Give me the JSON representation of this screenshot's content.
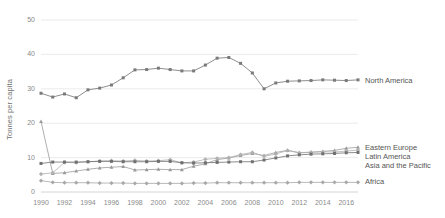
{
  "chart_data": {
    "type": "line",
    "title": "",
    "subtitle": "",
    "xlabel": "",
    "ylabel": "Tonnes per capita",
    "xlim": [
      1990,
      2017
    ],
    "ylim": [
      0,
      50
    ],
    "grid": true,
    "legend_position": "right-inline",
    "x": [
      1990,
      1991,
      1992,
      1993,
      1994,
      1995,
      1996,
      1997,
      1998,
      1999,
      2000,
      2001,
      2002,
      2003,
      2004,
      2005,
      2006,
      2007,
      2008,
      2009,
      2010,
      2011,
      2012,
      2013,
      2014,
      2015,
      2016,
      2017
    ],
    "xtick_labels": [
      "1990",
      "1992",
      "1994",
      "1996",
      "1998",
      "2000",
      "2002",
      "2004",
      "2006",
      "2008",
      "2010",
      "2012",
      "2014",
      "2016"
    ],
    "xtick_values": [
      1990,
      1992,
      1994,
      1996,
      1998,
      2000,
      2002,
      2004,
      2006,
      2008,
      2010,
      2012,
      2014,
      2016
    ],
    "ytick_labels": [
      "0",
      "10",
      "20",
      "30",
      "40",
      "50"
    ],
    "ytick_values": [
      0,
      10,
      20,
      30,
      40,
      50
    ],
    "series": [
      {
        "name": "North America",
        "color": "#7a7a7a",
        "marker": "square",
        "values": [
          28.7,
          27.6,
          28.5,
          27.4,
          29.7,
          30.2,
          31.1,
          33.2,
          35.5,
          35.6,
          36.0,
          35.6,
          35.2,
          35.2,
          36.9,
          38.9,
          39.1,
          37.4,
          34.6,
          30.0,
          31.7,
          32.2,
          32.3,
          32.4,
          32.6,
          32.5,
          32.4,
          32.6
        ]
      },
      {
        "name": "Eastern Europe",
        "color": "#9a9a9a",
        "marker": "triangle",
        "values": [
          20.5,
          5.4,
          5.6,
          6.1,
          6.6,
          7.0,
          7.2,
          7.4,
          6.4,
          6.5,
          6.6,
          6.5,
          6.5,
          7.5,
          8.2,
          9.4,
          9.9,
          10.6,
          11.2,
          10.6,
          11.5,
          12.1,
          11.4,
          11.6,
          11.8,
          12.1,
          12.7,
          13.0
        ]
      },
      {
        "name": "Latin America",
        "color": "#b0b0b0",
        "marker": "diamond",
        "values": [
          5.2,
          5.6,
          8.6,
          8.5,
          8.8,
          9.0,
          9.1,
          9.0,
          9.2,
          9.0,
          9.1,
          9.4,
          8.5,
          8.7,
          9.5,
          9.8,
          10.0,
          10.9,
          11.5,
          10.4,
          11.0,
          12.1,
          11.4,
          11.5,
          11.7,
          11.6,
          11.9,
          12.2
        ]
      },
      {
        "name": "Asia and the Pacific",
        "color": "#707070",
        "marker": "square",
        "values": [
          8.3,
          8.7,
          8.7,
          8.7,
          8.8,
          8.9,
          8.9,
          8.8,
          8.8,
          8.8,
          8.9,
          8.9,
          8.5,
          8.4,
          8.5,
          8.6,
          8.7,
          8.8,
          8.8,
          9.3,
          9.9,
          10.5,
          10.8,
          11.0,
          11.1,
          11.2,
          11.4,
          11.5
        ]
      },
      {
        "name": "Africa",
        "color": "#a8a8a8",
        "marker": "diamond",
        "values": [
          3.3,
          2.8,
          2.7,
          2.7,
          2.7,
          2.6,
          2.6,
          2.6,
          2.5,
          2.5,
          2.5,
          2.5,
          2.5,
          2.6,
          2.6,
          2.7,
          2.7,
          2.7,
          2.7,
          2.7,
          2.7,
          2.7,
          2.8,
          2.8,
          2.8,
          2.8,
          2.8,
          2.8
        ]
      }
    ],
    "annotations": [
      {
        "name": "North America",
        "text": "North America"
      },
      {
        "name": "Eastern Europe",
        "text": "Eastern Europe"
      },
      {
        "name": "Latin America",
        "text": "Latin America"
      },
      {
        "name": "Asia and the Pacific",
        "text": "Asia and the Pacific"
      },
      {
        "name": "Africa",
        "text": "Africa"
      }
    ],
    "colors": {
      "gridline": "#e6e6e6",
      "tick_text": "#8a8a8a",
      "label_text": "#555555",
      "background": "#ffffff"
    }
  },
  "labels": {
    "y_axis_title": "Tonnes per capita",
    "legend": {
      "north_america": "North America",
      "eastern_europe": "Eastern Europe",
      "latin_america": "Latin America",
      "asia_pacific": "Asia and the Pacific",
      "africa": "Africa"
    }
  }
}
